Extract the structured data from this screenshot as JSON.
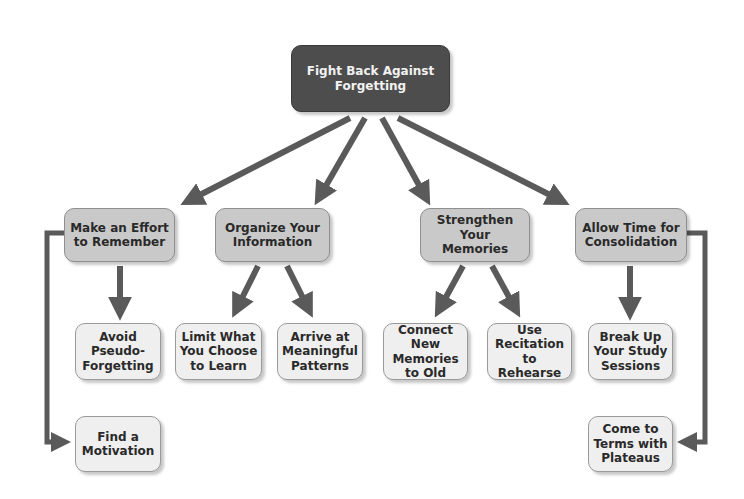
{
  "diagram": {
    "root": {
      "label": "Fight Back Against\nForgetting"
    },
    "branches": [
      {
        "label": "Make an Effort\nto Remember",
        "children": [
          {
            "label": "Avoid\nPseudo-\nForgetting"
          },
          {
            "label": "Find a\nMotivation"
          }
        ]
      },
      {
        "label": "Organize Your\nInformation",
        "children": [
          {
            "label": "Limit What\nYou Choose\nto Learn"
          },
          {
            "label": "Arrive at\nMeaningful\nPatterns"
          }
        ]
      },
      {
        "label": "Strengthen Your\nMemories",
        "children": [
          {
            "label": "Connect New\nMemories\nto Old"
          },
          {
            "label": "Use\nRecitation to\nRehearse"
          }
        ]
      },
      {
        "label": "Allow Time for\nConsolidation",
        "children": [
          {
            "label": "Break Up\nYour Study\nSessions"
          },
          {
            "label": "Come to\nTerms with\nPlateaus"
          }
        ]
      }
    ],
    "colors": {
      "root_fill": "#4d4d4d",
      "branch_fill": "#c9c9c9",
      "leaf_fill": "#efefef",
      "arrow": "#5a5a5a"
    }
  }
}
